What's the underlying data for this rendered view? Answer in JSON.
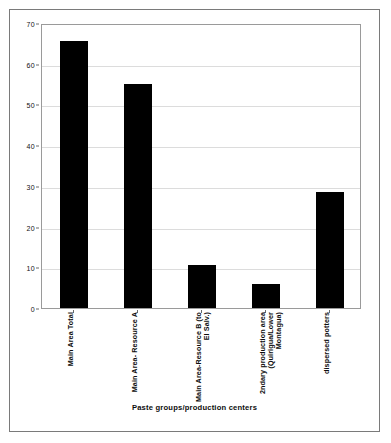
{
  "chart_data": {
    "type": "bar",
    "title": "",
    "xlabel": "Paste groups/production centers",
    "ylabel": "",
    "ylim": [
      0,
      70
    ],
    "ytick_step": 10,
    "yticks": [
      "0",
      "10",
      "20",
      "30",
      "40",
      "50",
      "60",
      "70"
    ],
    "grid": true,
    "legend": "none",
    "bar_color": "#000000",
    "categories": [
      "Main Area Total",
      "Main Area- Resource A",
      "Main Area-Resource B (to\nEl Salv.)",
      "2ndary production area\n(Quirigua/Lower\nMontagua)",
      "dispersed potters"
    ],
    "values": [
      65.5,
      55,
      10.5,
      6,
      28.5
    ]
  },
  "axes": {
    "y_ticks": [
      {
        "label": "70",
        "value": 70
      },
      {
        "label": "60",
        "value": 60
      },
      {
        "label": "50",
        "value": 50
      },
      {
        "label": "40",
        "value": 40
      },
      {
        "label": "30",
        "value": 30
      },
      {
        "label": "20",
        "value": 20
      },
      {
        "label": "10",
        "value": 10
      },
      {
        "label": "0",
        "value": 0
      }
    ]
  },
  "colors": {
    "bar": "#000000",
    "frame": "#7a7a7a",
    "plot_border": "#9a9a9a",
    "gridline": "#dcdcdc",
    "text": "#0d0d0d",
    "background": "#ffffff"
  }
}
